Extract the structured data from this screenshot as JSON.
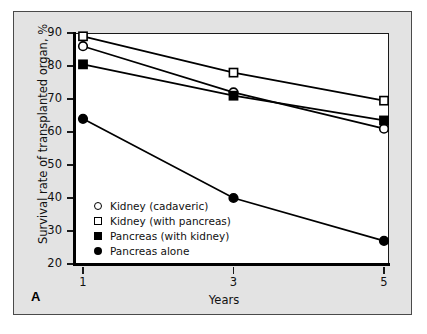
{
  "figure": {
    "panel_label": "A"
  },
  "chart_data": {
    "type": "line",
    "title": "",
    "xlabel": "Years",
    "ylabel": "Survival rate of transplanted organ, %",
    "x": [
      1,
      3,
      5
    ],
    "xtick_labels": [
      "1",
      "3",
      "5"
    ],
    "xlim": [
      0,
      6
    ],
    "ylim": [
      20,
      90
    ],
    "ytick_labels": [
      "90",
      "80",
      "70",
      "60",
      "50",
      "40",
      "30",
      "20"
    ],
    "ytick_values": [
      90,
      80,
      70,
      60,
      50,
      40,
      30,
      20
    ],
    "grid": false,
    "legend_position": "lower-left-inside",
    "series": [
      {
        "name": "Kidney (cadaveric)",
        "marker": "open-circle",
        "values": [
          86,
          72,
          61
        ]
      },
      {
        "name": "Kidney (with pancreas)",
        "marker": "open-square",
        "values": [
          89,
          78,
          69.5
        ]
      },
      {
        "name": "Pancreas (with kidney)",
        "marker": "filled-square",
        "values": [
          80.5,
          71,
          63.5
        ]
      },
      {
        "name": "Pancreas alone",
        "marker": "filled-circle",
        "values": [
          64,
          40,
          27
        ]
      }
    ],
    "colors": {
      "line": "#000000",
      "marker_fill_open": "#ffffff",
      "marker_fill_closed": "#000000",
      "plot_background": "#ffffff",
      "figure_background": "#e3e3e3"
    }
  }
}
